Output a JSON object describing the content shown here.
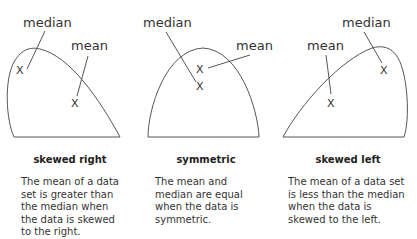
{
  "panels": [
    {
      "id": "skewed-right",
      "title": "skewed right",
      "median_label": "median",
      "mean_label": "mean",
      "marker": "X",
      "description": [
        "The mean of a data",
        "set is greater than",
        "the median when",
        "the data is skewed",
        "to the right."
      ]
    },
    {
      "id": "symmetric",
      "title": "symmetric",
      "median_label": "median",
      "mean_label": "mean",
      "marker": "X",
      "description": [
        "The mean and",
        "median are equal",
        "when the data is",
        "symmetric."
      ]
    },
    {
      "id": "skewed-left",
      "title": "skewed left",
      "median_label": "median",
      "mean_label": "mean",
      "marker": "X",
      "description": [
        "The mean of a data set",
        "is less than the median",
        "when the data is",
        "skewed to the left."
      ]
    }
  ],
  "colors": {
    "stroke": "#555555",
    "text": "#333333"
  }
}
